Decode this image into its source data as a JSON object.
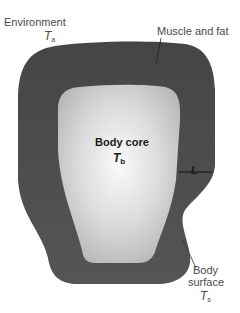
{
  "diagram": {
    "environment": {
      "label": "Environment",
      "symbol": "T",
      "subscript": "a"
    },
    "muscle_fat": {
      "label": "Muscle and fat"
    },
    "body_core": {
      "label": "Body core",
      "symbol": "T",
      "subscript": "b"
    },
    "thickness": {
      "symbol": "L"
    },
    "body_surface": {
      "line1": "Body",
      "line2": "surface",
      "symbol": "T",
      "subscript": "s"
    }
  },
  "colors": {
    "outer_shell": "#4d4d4d",
    "core_center": "#f7f7f7",
    "core_edge": "#bdbdbd",
    "text": "#4a4a4a"
  }
}
